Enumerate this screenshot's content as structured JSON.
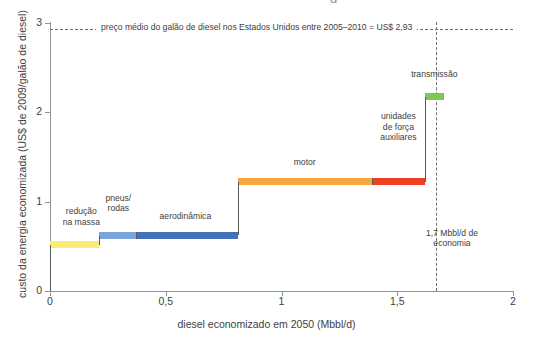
{
  "figure": {
    "title_remnant": "g",
    "plot": {
      "x_axis_label": "diesel economizado em 2050 (Mbbl/d)",
      "y_axis_label": "custo da energia economizada (US$ de 2009/galão de diesel)",
      "x_ticks": [
        "0",
        "0,5",
        "1",
        "1,5",
        "2"
      ],
      "y_ticks": [
        "0",
        "1",
        "2",
        "3"
      ]
    },
    "reference_line_label": "preço médio do galão de diesel nos Estados Unidos entre 2005–2010 = US$ 2,93",
    "vertical_reference_label": "1,7 Mbbl/d\nde economia"
  },
  "chart_data": {
    "type": "bar",
    "subtype": "marginal-abatement-cost-curve",
    "title": "",
    "xlabel": "diesel economizado em 2050 (Mbbl/d)",
    "ylabel": "custo da energia economizada (US$ de 2009/galão de diesel)",
    "xlim": [
      0,
      2
    ],
    "ylim": [
      0,
      3
    ],
    "x_tick_values": [
      0,
      0.5,
      1,
      1.5,
      2
    ],
    "y_tick_values": [
      0,
      1,
      2,
      3
    ],
    "x_tick_labels": [
      "0",
      "0,5",
      "1",
      "1,5",
      "2"
    ],
    "y_tick_labels": [
      "0",
      "1",
      "2",
      "3"
    ],
    "grid": false,
    "legend": "none",
    "categories": [
      "redução na massa",
      "pneus/rodas",
      "aerodinâmica",
      "motor",
      "unidades de força auxiliares",
      "transmissão"
    ],
    "values": [
      0.52,
      0.62,
      0.62,
      1.22,
      1.22,
      2.17
    ],
    "widths": [
      0.21,
      0.16,
      0.44,
      0.58,
      0.23,
      0.08
    ],
    "bars": [
      {
        "label": "redução\nna massa",
        "x_start": 0.0,
        "x_end": 0.21,
        "cost": 0.52,
        "color": "#f6ed71",
        "label_x": 0.135,
        "label_y": 0.83,
        "label_align": "center"
      },
      {
        "label": "pneus/\nrodas",
        "x_start": 0.21,
        "x_end": 0.37,
        "cost": 0.62,
        "color": "#7ba2d9",
        "label_x": 0.295,
        "label_y": 0.98,
        "label_align": "center"
      },
      {
        "label": "aerodinâmica",
        "x_start": 0.37,
        "x_end": 0.81,
        "cost": 0.62,
        "color": "#4472b8",
        "label_x": 0.585,
        "label_y": 0.84,
        "label_align": "center"
      },
      {
        "label": "motor",
        "x_start": 0.81,
        "x_end": 1.39,
        "cost": 1.22,
        "color": "#f8a83c",
        "label_x": 1.1,
        "label_y": 1.44,
        "label_align": "center"
      },
      {
        "label": "unidades\nde força\nauxiliares",
        "x_start": 1.39,
        "x_end": 1.62,
        "cost": 1.22,
        "color": "#ed4124",
        "label_x": 1.505,
        "label_y": 1.83,
        "label_align": "center"
      },
      {
        "label": "transmissão",
        "x_start": 1.62,
        "x_end": 1.7,
        "cost": 2.17,
        "color": "#7dc855",
        "label_x": 1.66,
        "label_y": 2.42,
        "label_align": "center"
      }
    ],
    "annotations": [
      {
        "type": "hline",
        "y": 2.93,
        "text": "preço médio do galão de diesel nos Estados Unidos entre 2005–2010 = US$ 2,93",
        "style": "dashed"
      },
      {
        "type": "vline",
        "x": 1.67,
        "text": "1,7 Mbbl/d\nde economia",
        "style": "dashed"
      }
    ],
    "colors": {
      "reducao_na_massa": "#f6ed71",
      "pneus_rodas": "#7ba2d9",
      "aerodinamica": "#4472b8",
      "motor": "#f8a83c",
      "unidades_de_forca_auxiliares": "#ed4124",
      "transmissao": "#7dc855",
      "axis": "#929497",
      "text": "#414042",
      "riser": "#58595b"
    }
  }
}
